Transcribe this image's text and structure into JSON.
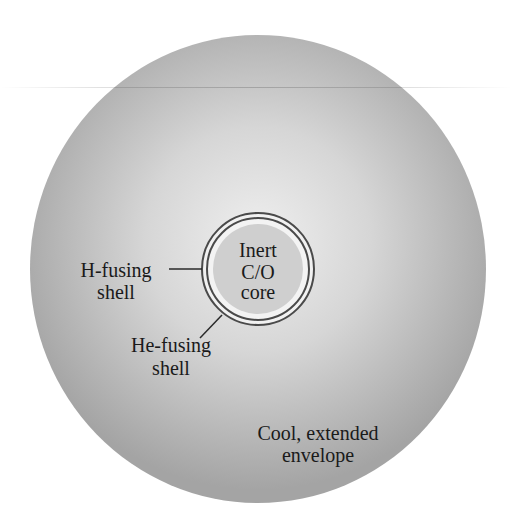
{
  "diagram": {
    "colors": {
      "background": "#ffffff",
      "envelope_center": "#ececec",
      "envelope_edge": "#a6a6a6",
      "core_fill": "#cfcfcf",
      "ring_stroke": "#4a4a4a",
      "ring_gap": "#f2f2f2",
      "text": "#1a1a1a"
    },
    "core": {
      "line1": "Inert",
      "line2": "C/O",
      "line3": "core"
    },
    "h_shell": {
      "line1": "H-fusing",
      "line2": "shell"
    },
    "he_shell": {
      "line1": "He-fusing",
      "line2": "shell"
    },
    "envelope": {
      "line1": "Cool, extended",
      "line2": "envelope"
    }
  }
}
